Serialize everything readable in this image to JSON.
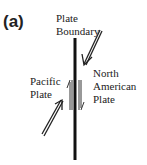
{
  "panel_label": "(a)",
  "labels": {
    "boundary_line1": "Plate",
    "boundary_line2": "Boundary",
    "pacific_line1": "Pacific",
    "pacific_line2": "Plate",
    "na_line1": "North",
    "na_line2": "American",
    "na_line3": "Plate"
  }
}
